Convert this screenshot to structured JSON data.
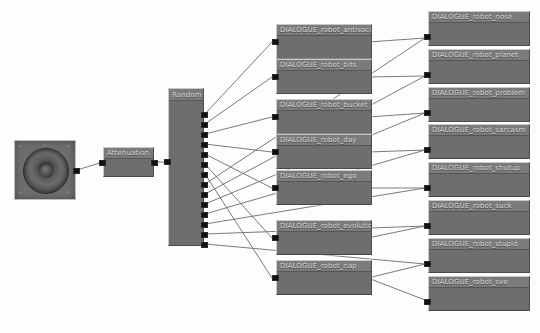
{
  "graph": {
    "source": {
      "name": "speaker-source",
      "icon": "speaker-icon"
    },
    "attenuation": {
      "title": "Attenuation"
    },
    "random": {
      "title": "Random",
      "output_count": 14
    },
    "middle_nodes": [
      {
        "title": "DIALOGUE_robot_antisocial"
      },
      {
        "title": "DIALOGUE_robot_bits"
      },
      {
        "title": "DIALOGUE_robot_bucket"
      },
      {
        "title": "DIALOGUE_robot_day"
      },
      {
        "title": "DIALOGUE_robot_ego"
      },
      {
        "title": "DIALOGUE_robot_evolution"
      },
      {
        "title": "DIALOGUE_robot_nap"
      }
    ],
    "right_nodes": [
      {
        "title": "DIALOGUE_robot_nose"
      },
      {
        "title": "DIALOGUE_robot_planet"
      },
      {
        "title": "DIALOGUE_robot_problem"
      },
      {
        "title": "DIALOGUE_robot_sarcasm"
      },
      {
        "title": "DIALOGUE_robot_shutup"
      },
      {
        "title": "DIALOGUE_robot_suck"
      },
      {
        "title": "DIALOGUE_robot_stupid"
      },
      {
        "title": "DIALOGUE_robot_sve"
      }
    ],
    "colors": {
      "node_fill": "#6e6e6e",
      "node_title": "#7b7b7b",
      "node_border": "#bdbdbd",
      "port": "#101010",
      "wire": "#6b6b6b",
      "canvas": "#fdfdfd"
    }
  }
}
